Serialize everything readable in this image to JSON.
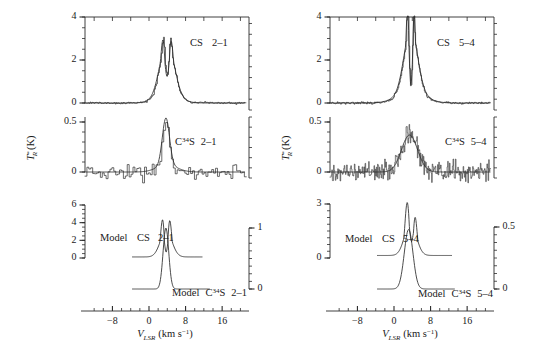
{
  "figure": {
    "title": "",
    "xlabel_main": "V",
    "xlabel_sub": "LSR",
    "xlabel_unit": "(km s",
    "xlabel_unit_sup": "−1",
    "xlabel_unit_close": ")",
    "ylabel_main": "T",
    "ylabel_sup": "*",
    "ylabel_sub": "R",
    "ylabel_unit": "(K)"
  },
  "panels": {
    "left": {
      "name": "CS 2-1 / C34S 2-1 panel",
      "top": {
        "annotation": "CS   2–1",
        "species": "CS",
        "transition": "2–1",
        "yticks": [
          "0",
          "2",
          "4"
        ],
        "ytick_values": [
          0,
          2,
          4
        ],
        "ylim": [
          -0.45,
          4.0
        ]
      },
      "middle": {
        "annotation_prefix": "C",
        "annotation_sup": "34",
        "annotation_mid": "S",
        "annotation_transition": "2–1",
        "yticks": [
          "0",
          "0.5"
        ],
        "ytick_values": [
          0,
          0.5
        ],
        "ylim": [
          -0.28,
          0.62
        ]
      },
      "bottom": {
        "model_cs_label_prefix": "Model",
        "model_cs_species": "CS",
        "model_cs_transition": "2–1",
        "model_c34s_label_prefix": "Model",
        "model_c34s_species_prefix": "C",
        "model_c34s_species_sup": "34",
        "model_c34s_species_mid": "S",
        "model_c34s_transition": "2–1",
        "yticks_left": [
          "0",
          "2",
          "4",
          "6"
        ],
        "ytick_left_values": [
          0,
          2,
          4,
          6
        ],
        "ylim_left": [
          0,
          6.6
        ],
        "yticks_right": [
          "0",
          "1"
        ],
        "ytick_right_values": [
          0,
          1
        ],
        "ylim_right": [
          -0.55,
          1.35
        ]
      },
      "xticks": [
        "−8",
        "0",
        "8",
        "16"
      ],
      "xtick_values": [
        -8,
        0,
        8,
        16
      ],
      "xlim": [
        -14,
        21
      ]
    },
    "right": {
      "name": "CS 5-4 / C34S 5-4 panel",
      "top": {
        "annotation": "CS   5–4",
        "species": "CS",
        "transition": "5–4",
        "yticks": [
          "0",
          "2",
          "4"
        ],
        "ytick_values": [
          0,
          2,
          4
        ],
        "ylim": [
          -0.45,
          4.0
        ]
      },
      "middle": {
        "annotation_prefix": "C",
        "annotation_sup": "34",
        "annotation_mid": "S",
        "annotation_transition": "5–4",
        "yticks": [
          "0",
          "0.5"
        ],
        "ytick_values": [
          0,
          0.5
        ],
        "ylim": [
          -0.3,
          0.62
        ]
      },
      "bottom": {
        "model_cs_label_prefix": "Model",
        "model_cs_species": "CS",
        "model_cs_transition": "5–4",
        "model_c34s_label_prefix": "Model",
        "model_c34s_species_prefix": "C",
        "model_c34s_species_sup": "34",
        "model_c34s_species_mid": "S",
        "model_c34s_transition": "5–4",
        "yticks_left": [
          "0",
          "3"
        ],
        "ytick_left_values": [
          0,
          3
        ],
        "ylim_left": [
          0,
          3.5
        ],
        "yticks_right": [
          "0",
          "0.5"
        ],
        "ytick_right_values": [
          0,
          0.5
        ],
        "ylim_right": [
          -0.3,
          0.68
        ]
      },
      "xticks": [
        "−8",
        "0",
        "8",
        "16"
      ],
      "xtick_values": [
        -8,
        0,
        8,
        16
      ],
      "xlim": [
        -14,
        21
      ]
    }
  },
  "chart_data": {
    "type": "line",
    "xlabel": "V_LSR (km s^-1)",
    "ylabel": "T*_R (K)",
    "xlim": [
      -14,
      21
    ],
    "grid": false,
    "legend": "none",
    "subplots": [
      {
        "id": "left-top",
        "annotation": "CS 2-1",
        "ylim": [
          -0.45,
          4.0
        ],
        "yticks": [
          0,
          2,
          4
        ],
        "series": [
          {
            "name": "CS 2-1 observed",
            "style": "noisy-line",
            "peak_velocity": 3.2,
            "peak_value": 2.95,
            "secondary_peak_velocity": 4.6,
            "secondary_peak_value": 2.9,
            "self_absorption_dip_velocity": 3.9,
            "self_absorption_dip_value": 1.45,
            "baseline": 0.0,
            "linewidth_kms": 3.2,
            "noise_rms": 0.05
          },
          {
            "name": "CS 2-1 model",
            "style": "smooth-line",
            "peak_velocity": 3.2,
            "peak_value": 2.85,
            "secondary_peak_velocity": 4.7,
            "secondary_peak_value": 2.75,
            "self_absorption_dip_velocity": 3.95,
            "self_absorption_dip_value": 1.3,
            "baseline": 0.0,
            "linewidth_kms": 3.4
          }
        ]
      },
      {
        "id": "left-middle",
        "annotation": "C34S 2-1",
        "ylim": [
          -0.28,
          0.62
        ],
        "yticks": [
          0,
          0.5
        ],
        "series": [
          {
            "name": "C34S 2-1 observed",
            "style": "histogram-noisy",
            "peak_velocity": 3.7,
            "peak_value": 0.56,
            "baseline": 0.0,
            "linewidth_kms": 1.6,
            "noise_rms": 0.085
          },
          {
            "name": "C34S 2-1 model",
            "style": "smooth-line",
            "peak_velocity": 3.7,
            "peak_value": 0.48,
            "baseline": 0.0,
            "linewidth_kms": 1.9
          }
        ]
      },
      {
        "id": "left-bottom",
        "annotation": "Model CS 2-1 / Model C34S 2-1",
        "ylim_left": [
          0,
          6.6
        ],
        "yticks_left": [
          0,
          2,
          4,
          6
        ],
        "ylim_right": [
          -0.55,
          1.35
        ],
        "yticks_right": [
          0,
          1
        ],
        "series": [
          {
            "name": "Model CS 2-1",
            "style": "smooth-line",
            "axis": "left",
            "peak_velocity": 3.0,
            "peak_value": 4.45,
            "secondary_peak_velocity": 4.5,
            "secondary_peak_value": 4.35,
            "self_absorption_dip_velocity": 3.75,
            "self_absorption_dip_value": 2.05,
            "baseline": 0.1,
            "linewidth_kms": 3.0,
            "x_start": -3.5,
            "x_end": 11.5
          },
          {
            "name": "Model C34S 2-1",
            "style": "smooth-line",
            "axis": "right",
            "peak_velocity": 3.7,
            "peak_value": 1.02,
            "baseline": 0.0,
            "linewidth_kms": 1.5,
            "x_start": -3.5,
            "x_end": 13.0
          }
        ]
      },
      {
        "id": "right-top",
        "annotation": "CS 5-4",
        "ylim": [
          -0.45,
          4.0
        ],
        "yticks": [
          0,
          2,
          4
        ],
        "series": [
          {
            "name": "CS 5-4 observed",
            "style": "noisy-line",
            "peak_velocity": 3.0,
            "peak_value": 4.0,
            "secondary_peak_velocity": 4.3,
            "secondary_peak_value": 3.85,
            "self_absorption_dip_velocity": 3.7,
            "self_absorption_dip_value": 1.1,
            "baseline": 0.0,
            "linewidth_kms": 3.6,
            "noise_rms": 0.07
          },
          {
            "name": "CS 5-4 model",
            "style": "smooth-line",
            "peak_velocity": 3.0,
            "peak_value": 4.0,
            "secondary_peak_velocity": 4.3,
            "secondary_peak_value": 3.7,
            "self_absorption_dip_velocity": 3.7,
            "self_absorption_dip_value": 1.0,
            "baseline": 0.0,
            "linewidth_kms": 3.6
          }
        ]
      },
      {
        "id": "right-middle",
        "annotation": "C34S 5-4",
        "ylim": [
          -0.3,
          0.62
        ],
        "yticks": [
          0,
          0.5
        ],
        "series": [
          {
            "name": "C34S 5-4 observed",
            "style": "very-noisy-line",
            "peak_velocity": 3.4,
            "peak_value": 0.42,
            "baseline": 0.0,
            "linewidth_kms": 4.0,
            "noise_rms": 0.13
          },
          {
            "name": "C34S 5-4 model",
            "style": "smooth-line",
            "peak_velocity": 3.4,
            "peak_value": 0.38,
            "baseline": 0.0,
            "linewidth_kms": 4.2
          }
        ]
      },
      {
        "id": "right-bottom",
        "annotation": "Model CS 5-4 / Model C34S 5-4",
        "ylim_left": [
          0,
          3.5
        ],
        "yticks_left": [
          0,
          3
        ],
        "ylim_right": [
          -0.3,
          0.68
        ],
        "yticks_right": [
          0,
          0.5
        ],
        "series": [
          {
            "name": "Model CS 5-4",
            "style": "smooth-line",
            "axis": "left",
            "peak_velocity": 2.9,
            "peak_value": 3.05,
            "secondary_peak_velocity": 4.6,
            "secondary_peak_value": 2.25,
            "self_absorption_dip_velocity": 3.8,
            "self_absorption_dip_value": 1.95,
            "baseline": 0.12,
            "linewidth_kms": 3.0,
            "x_start": -3.5,
            "x_end": 12.5
          },
          {
            "name": "Model C34S 5-4",
            "style": "smooth-line",
            "axis": "right",
            "peak_velocity": 3.2,
            "peak_value": 0.49,
            "baseline": 0.0,
            "linewidth_kms": 2.2,
            "x_start": -3.5,
            "x_end": 13.0
          }
        ]
      }
    ]
  }
}
